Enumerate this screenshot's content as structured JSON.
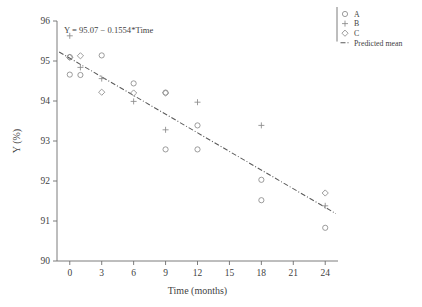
{
  "chart_data": {
    "type": "scatter",
    "title": "",
    "xlabel": "Time (months)",
    "ylabel": "Y (%)",
    "xlim": [
      -1.2,
      25.2
    ],
    "ylim": [
      90,
      96
    ],
    "xticks": [
      0,
      3,
      6,
      9,
      12,
      15,
      18,
      21,
      24
    ],
    "yticks": [
      90,
      91,
      92,
      93,
      94,
      95,
      96
    ],
    "xticklabels": [
      "0",
      "3",
      "6",
      "9",
      "12",
      "15",
      "18",
      "21",
      "24"
    ],
    "yticklabels": [
      "90",
      "91",
      "92",
      "93",
      "94",
      "95",
      "96"
    ],
    "grid": false,
    "legend_position": "outside-top-right",
    "annotation": "Y = 95.07 − 0.1554*Time",
    "series": [
      {
        "name": "A",
        "marker": "circle",
        "points": [
          {
            "x": 0,
            "y": 95.1
          },
          {
            "x": 0,
            "y": 94.66
          },
          {
            "x": 1,
            "y": 94.65
          },
          {
            "x": 3,
            "y": 95.14
          },
          {
            "x": 6,
            "y": 94.44
          },
          {
            "x": 9,
            "y": 94.21
          },
          {
            "x": 9,
            "y": 92.79
          },
          {
            "x": 12,
            "y": 93.39
          },
          {
            "x": 12,
            "y": 92.79
          },
          {
            "x": 18,
            "y": 92.03
          },
          {
            "x": 18,
            "y": 91.52
          },
          {
            "x": 24,
            "y": 90.83
          }
        ]
      },
      {
        "name": "B",
        "marker": "plus",
        "points": [
          {
            "x": 0,
            "y": 95.63
          },
          {
            "x": 1,
            "y": 94.84
          },
          {
            "x": 3,
            "y": 94.56
          },
          {
            "x": 6,
            "y": 93.99
          },
          {
            "x": 9,
            "y": 93.28
          },
          {
            "x": 12,
            "y": 93.97
          },
          {
            "x": 18,
            "y": 93.39
          },
          {
            "x": 24,
            "y": 91.38
          }
        ]
      },
      {
        "name": "C",
        "marker": "diamond",
        "points": [
          {
            "x": 0,
            "y": 95.09
          },
          {
            "x": 1,
            "y": 95.13
          },
          {
            "x": 3,
            "y": 94.22
          },
          {
            "x": 6,
            "y": 94.2
          },
          {
            "x": 9,
            "y": 94.2
          },
          {
            "x": 24,
            "y": 91.7
          }
        ]
      }
    ],
    "fit_line": {
      "name": "Predicted mean",
      "intercept": 95.07,
      "slope": -0.1554,
      "x_start": -1.0,
      "x_end": 25.0,
      "style": "dash-dot"
    }
  },
  "legend": {
    "entries": [
      {
        "label": "A",
        "marker": "circle"
      },
      {
        "label": "B",
        "marker": "plus"
      },
      {
        "label": "C",
        "marker": "diamond"
      },
      {
        "label": "Predicted mean",
        "marker": "dash-dot-line"
      }
    ]
  },
  "colors": {
    "marker": "#8a8a8a",
    "line": "#5a5a5a",
    "axis": "#6e6e6e",
    "text": "#3f3f3f",
    "background": "#ffffff"
  }
}
